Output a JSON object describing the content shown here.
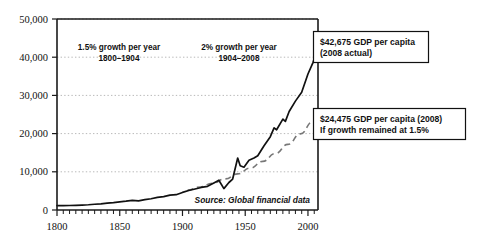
{
  "chart_data": {
    "type": "line",
    "title": "",
    "xlabel": "",
    "ylabel": "",
    "xlim": [
      1800,
      2008
    ],
    "ylim": [
      0,
      50000
    ],
    "grid": true,
    "legend_position": "none",
    "y_ticks": [
      "0",
      "10,000",
      "20,000",
      "30,000",
      "40,000",
      "50,000"
    ],
    "y_tick_values": [
      0,
      10000,
      20000,
      30000,
      40000,
      50000
    ],
    "x_ticks": [
      "1800",
      "1850",
      "1900",
      "1950",
      "2000"
    ],
    "x_tick_values": [
      1800,
      1850,
      1900,
      1950,
      2000
    ],
    "x_minor_tick_interval": 5,
    "series": [
      {
        "name": "Actual GDP per capita",
        "style": "solid",
        "color": "#111111",
        "x": [
          1800,
          1805,
          1810,
          1815,
          1820,
          1825,
          1830,
          1835,
          1840,
          1845,
          1850,
          1855,
          1860,
          1865,
          1870,
          1875,
          1880,
          1885,
          1890,
          1895,
          1900,
          1905,
          1910,
          1915,
          1920,
          1925,
          1929,
          1933,
          1937,
          1940,
          1944,
          1946,
          1949,
          1953,
          1957,
          1960,
          1965,
          1970,
          1973,
          1975,
          1980,
          1982,
          1985,
          1990,
          1995,
          2000,
          2004,
          2006,
          2007,
          2008
        ],
        "y": [
          1150,
          1120,
          1180,
          1230,
          1300,
          1380,
          1500,
          1620,
          1800,
          1950,
          2150,
          2300,
          2500,
          2380,
          2700,
          2950,
          3300,
          3500,
          3900,
          4000,
          4600,
          5100,
          5500,
          5900,
          6200,
          7100,
          7800,
          5600,
          7200,
          8100,
          13600,
          11600,
          11200,
          13000,
          13600,
          14200,
          16800,
          19200,
          21500,
          21000,
          23800,
          23200,
          25800,
          28500,
          30800,
          35600,
          38600,
          40600,
          41800,
          42675
        ]
      },
      {
        "name": "1.5% growth trend counterfactual",
        "style": "dashed",
        "color": "#777777",
        "x": [
          1904,
          1914,
          1924,
          1934,
          1944,
          1954,
          1964,
          1974,
          1984,
          1994,
          2004,
          2008
        ],
        "y": [
          5200,
          6040,
          7010,
          8140,
          9450,
          10970,
          12740,
          14790,
          17170,
          19940,
          23150,
          24475
        ]
      }
    ],
    "annotations": [
      {
        "name": "growth-label-1",
        "line1": "1.5% growth per year",
        "line2": "1800–1904"
      },
      {
        "name": "growth-label-2",
        "line1": "2% growth per year",
        "line2": "1904–2008"
      },
      {
        "name": "callout-actual",
        "line1": "$42,675 GDP per capita",
        "line2": "(2008 actual)"
      },
      {
        "name": "callout-counterfactual",
        "line1": "$24,475 GDP per capita (2008)",
        "line2": "If growth remained at 1.5%"
      },
      {
        "name": "source-note",
        "line1": "Source: Global financial data"
      }
    ],
    "colors": {
      "actual_line": "#111111",
      "trend_line": "#777777",
      "gridline": "#b9b9b9",
      "axis": "#1a1a1a",
      "background": "#ffffff"
    }
  }
}
